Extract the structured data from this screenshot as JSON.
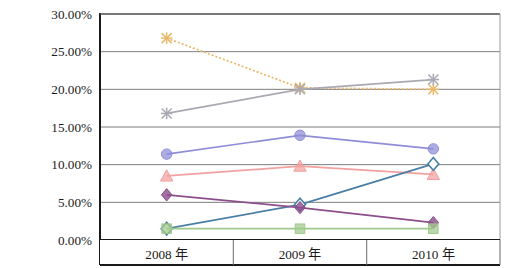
{
  "chart_data": {
    "type": "line",
    "title": "",
    "subtitle": "",
    "xlabel": "",
    "ylabel": "",
    "categories": [
      "2008 年",
      "2009 年",
      "2010 年"
    ],
    "ylim": [
      0,
      30
    ],
    "ytick_labels": [
      "0.00%",
      "5.00%",
      "10.00%",
      "15.00%",
      "20.00%",
      "25.00%",
      "30.00%"
    ],
    "ytick_values": [
      0,
      5,
      10,
      15,
      20,
      25,
      30
    ],
    "grid": "horizontal",
    "legend": "none",
    "value_suffix": "%",
    "series": [
      {
        "name": "series-1",
        "values": [
          26.8,
          20.2,
          20.0
        ],
        "color": "#e8b96a",
        "marker": "x",
        "dash": "2 2"
      },
      {
        "name": "series-2",
        "values": [
          16.8,
          20.0,
          21.3
        ],
        "color": "#a9a9b3",
        "marker": "x",
        "dash": "none"
      },
      {
        "name": "series-3",
        "values": [
          11.4,
          13.9,
          12.1
        ],
        "color": "#8e8ed8",
        "marker": "circle",
        "dash": "none"
      },
      {
        "name": "series-4",
        "values": [
          8.5,
          9.8,
          8.7
        ],
        "color": "#f2a0a0",
        "marker": "triangle",
        "dash": "none"
      },
      {
        "name": "series-5",
        "values": [
          1.5,
          4.7,
          10.1
        ],
        "color": "#4a7fa5",
        "marker": "diamond-open",
        "dash": "none"
      },
      {
        "name": "series-6",
        "values": [
          6.0,
          4.3,
          2.3
        ],
        "color": "#8c4f8c",
        "marker": "diamond",
        "dash": "none"
      },
      {
        "name": "series-7",
        "values": [
          1.5,
          1.5,
          1.5
        ],
        "color": "#9fc98a",
        "marker": "square",
        "dash": "none"
      }
    ]
  },
  "axes": {
    "y_axis_name": "percent-axis",
    "x_axis_name": "year-axis"
  }
}
